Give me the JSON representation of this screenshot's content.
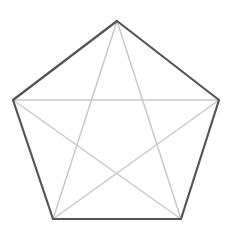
{
  "figure": {
    "kind": "geometric-diagram",
    "shape_name": "pentagon",
    "canvas": {
      "width": 237,
      "height": 236,
      "background": "#ffffff"
    },
    "colors": {
      "outline": "#555555",
      "diagonal": "#c9c9c9",
      "background": "#ffffff"
    },
    "stroke_widths": {
      "outline": 2.2,
      "diagonal": 1.5
    },
    "vertices": [
      {
        "id": "top",
        "label": "A",
        "x": 117,
        "y": 21
      },
      {
        "id": "right",
        "label": "B",
        "x": 219,
        "y": 100
      },
      {
        "id": "bottom-right",
        "label": "C",
        "x": 181,
        "y": 219
      },
      {
        "id": "bottom-left",
        "label": "D",
        "x": 53,
        "y": 219
      },
      {
        "id": "left",
        "label": "E",
        "x": 13,
        "y": 100
      }
    ],
    "outline_edges": [
      {
        "id": "edge-top-right",
        "from": "top",
        "to": "right"
      },
      {
        "id": "edge-right-lower",
        "from": "right",
        "to": "bottom-right"
      },
      {
        "id": "edge-bottom",
        "from": "bottom-right",
        "to": "bottom-left"
      },
      {
        "id": "edge-left-lower",
        "from": "bottom-left",
        "to": "left"
      },
      {
        "id": "edge-top-left",
        "from": "left",
        "to": "top"
      }
    ],
    "diagonals": [
      {
        "id": "diagonal-top-to-bottom-right",
        "from": "top",
        "to": "bottom-right"
      },
      {
        "id": "diagonal-top-to-bottom-left",
        "from": "top",
        "to": "bottom-left"
      },
      {
        "id": "diagonal-right-to-bottom-left",
        "from": "right",
        "to": "bottom-left"
      },
      {
        "id": "diagonal-right-to-left",
        "from": "right",
        "to": "left"
      },
      {
        "id": "diagonal-bottom-right-to-left",
        "from": "bottom-right",
        "to": "left"
      }
    ],
    "star_center": {
      "x": 117,
      "y": 128
    },
    "lower_crossing": {
      "x": 117,
      "y": 172
    },
    "labels_visible": false
  }
}
